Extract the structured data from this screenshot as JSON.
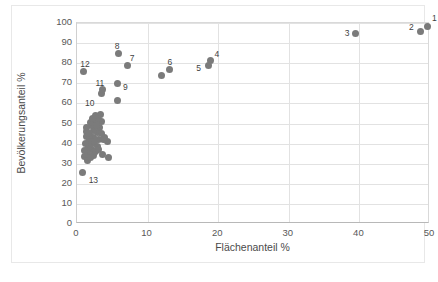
{
  "chart_data": {
    "type": "scatter",
    "title": "",
    "xlabel": "Flächenanteil %",
    "ylabel": "Bevölkerungsanteil %",
    "xlim": [
      0,
      50
    ],
    "ylim": [
      0,
      100
    ],
    "xticks": [
      0,
      10,
      20,
      30,
      40,
      50
    ],
    "yticks": [
      0,
      10,
      20,
      30,
      40,
      50,
      60,
      70,
      80,
      90,
      100
    ],
    "grid": true,
    "legend": "none",
    "marker_color": "#7b7b7b",
    "series": [
      {
        "name": "Regionen",
        "points": [
          {
            "label": "1",
            "x": 49.7,
            "y": 98.3
          },
          {
            "label": "2",
            "x": 48.6,
            "y": 95.6
          },
          {
            "label": "3",
            "x": 39.5,
            "y": 94.6
          },
          {
            "label": "4",
            "x": 18.9,
            "y": 81.4
          },
          {
            "label": "5",
            "x": 18.6,
            "y": 78.9
          },
          {
            "label": "6",
            "x": 13.1,
            "y": 77.0
          },
          {
            "label": "7",
            "x": 7.2,
            "y": 78.9
          },
          {
            "label": "8",
            "x": 5.9,
            "y": 84.6
          },
          {
            "label": "9",
            "x": 5.8,
            "y": 69.8
          },
          {
            "label": "10",
            "x": 3.4,
            "y": 64.9
          },
          {
            "label": "11",
            "x": 3.6,
            "y": 66.8
          },
          {
            "label": "12",
            "x": 0.9,
            "y": 76.0
          },
          {
            "label": "13",
            "x": 0.8,
            "y": 25.7
          },
          {
            "label": "",
            "x": 11.9,
            "y": 73.9
          },
          {
            "label": "",
            "x": 5.8,
            "y": 61.6
          },
          {
            "label": "",
            "x": 4.3,
            "y": 40.8
          },
          {
            "label": "",
            "x": 4.4,
            "y": 33.2
          },
          {
            "label": "",
            "x": 3.6,
            "y": 34.7
          },
          {
            "label": "",
            "x": 3.9,
            "y": 42.8
          },
          {
            "label": "",
            "x": 3.7,
            "y": 41.9
          },
          {
            "label": "",
            "x": 3.4,
            "y": 50.8
          },
          {
            "label": "",
            "x": 3.3,
            "y": 54.3
          },
          {
            "label": "",
            "x": 3.1,
            "y": 52.0
          },
          {
            "label": "",
            "x": 3.2,
            "y": 47.9
          },
          {
            "label": "",
            "x": 2.9,
            "y": 45.4
          },
          {
            "label": "",
            "x": 2.7,
            "y": 51.2
          },
          {
            "label": "",
            "x": 2.6,
            "y": 54.2
          },
          {
            "label": "",
            "x": 2.5,
            "y": 49.3
          },
          {
            "label": "",
            "x": 2.4,
            "y": 46.7
          },
          {
            "label": "",
            "x": 2.3,
            "y": 43.2
          },
          {
            "label": "",
            "x": 2.2,
            "y": 39.9
          },
          {
            "label": "",
            "x": 2.1,
            "y": 37.3
          },
          {
            "label": "",
            "x": 2.0,
            "y": 48.8
          },
          {
            "label": "",
            "x": 1.9,
            "y": 50.3
          },
          {
            "label": "",
            "x": 1.8,
            "y": 44.6
          },
          {
            "label": "",
            "x": 1.7,
            "y": 41.4
          },
          {
            "label": "",
            "x": 1.6,
            "y": 38.2
          },
          {
            "label": "",
            "x": 1.5,
            "y": 35.1
          },
          {
            "label": "",
            "x": 1.4,
            "y": 46.1
          },
          {
            "label": "",
            "x": 1.3,
            "y": 43.7
          },
          {
            "label": "",
            "x": 1.2,
            "y": 40.2
          },
          {
            "label": "",
            "x": 1.1,
            "y": 36.4
          },
          {
            "label": "",
            "x": 1.0,
            "y": 33.6
          },
          {
            "label": "",
            "x": 1.5,
            "y": 31.8
          },
          {
            "label": "",
            "x": 2.6,
            "y": 36.2
          },
          {
            "label": "",
            "x": 2.9,
            "y": 38.8
          },
          {
            "label": "",
            "x": 3.0,
            "y": 42.2
          },
          {
            "label": "",
            "x": 2.4,
            "y": 34.0
          },
          {
            "label": "",
            "x": 1.3,
            "y": 48.0
          },
          {
            "label": "",
            "x": 2.2,
            "y": 52.6
          },
          {
            "label": "",
            "x": 2.8,
            "y": 49.0
          },
          {
            "label": "",
            "x": 3.5,
            "y": 45.0
          },
          {
            "label": "",
            "x": 1.9,
            "y": 33.0
          },
          {
            "label": "",
            "x": 2.0,
            "y": 41.0
          },
          {
            "label": "",
            "x": 1.6,
            "y": 45.0
          },
          {
            "label": "",
            "x": 2.5,
            "y": 41.0
          },
          {
            "label": "",
            "x": 3.0,
            "y": 37.0
          }
        ]
      }
    ]
  },
  "label_offsets": {
    "1": {
      "dx": 4,
      "dy": -12
    },
    "2": {
      "dx": -11,
      "dy": -9
    },
    "3": {
      "dx": -11,
      "dy": -5
    },
    "4": {
      "dx": 4,
      "dy": -10
    },
    "5": {
      "dx": -12,
      "dy": -1
    },
    "6": {
      "dx": -2,
      "dy": -11
    },
    "7": {
      "dx": 2,
      "dy": -11
    },
    "8": {
      "dx": -4,
      "dy": -12
    },
    "9": {
      "dx": 5,
      "dy": -1
    },
    "10": {
      "dx": -16,
      "dy": 5
    },
    "11": {
      "dx": -7,
      "dy": -11
    },
    "12": {
      "dx": -3,
      "dy": -11
    },
    "13": {
      "dx": 6,
      "dy": 4
    }
  }
}
